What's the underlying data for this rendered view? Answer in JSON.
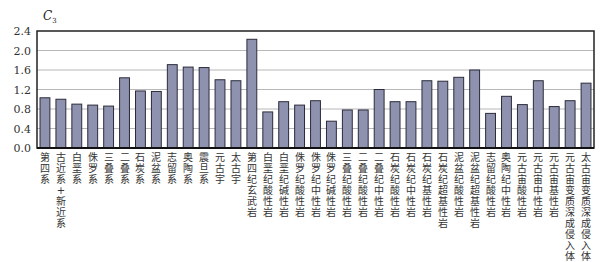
{
  "chart_data": {
    "type": "bar",
    "title": "",
    "xlabel": "",
    "ylabel": "C3",
    "ylabel_main": "C",
    "ylabel_sub": "3",
    "ylim": [
      0,
      2.4
    ],
    "yticks": [
      "0.0",
      "0.4",
      "0.8",
      "1.2",
      "1.6",
      "2.0",
      "2.4"
    ],
    "grid": true,
    "legend": null,
    "bar_color": "#8e92ae",
    "bar_edge_color": "#2b2b3a",
    "categories": [
      "第四系",
      "古近系+新近系",
      "白垩系",
      "侏罗系",
      "三叠系",
      "二叠系",
      "石炭系",
      "泥盆系",
      "志留系",
      "奥陶系",
      "震旦系",
      "元古宇",
      "太古宇",
      "第四纪玄武岩",
      "白垩纪酸性岩",
      "白垩纪碱性岩",
      "侏罗纪酸性岩",
      "侏罗纪中性岩",
      "侏罗纪碱性岩",
      "三叠纪酸性岩",
      "二叠纪酸性岩",
      "二叠纪中性岩",
      "石炭纪酸性岩",
      "石炭纪中性岩",
      "石炭纪基性岩",
      "石炭纪超基性岩",
      "泥盆纪酸性岩",
      "泥盆纪超基性岩",
      "志留纪酸性岩",
      "奥陶纪中性岩",
      "元古宙酸性岩",
      "元古宙中性岩",
      "元古宙基性岩",
      "元古宙变质深成侵入体",
      "太古宙变质深成侵入体"
    ],
    "values": [
      1.03,
      1.0,
      0.9,
      0.88,
      0.86,
      1.44,
      1.17,
      1.16,
      1.71,
      1.66,
      1.65,
      1.4,
      1.38,
      2.23,
      0.74,
      0.95,
      0.88,
      0.97,
      0.55,
      0.78,
      0.78,
      1.2,
      0.95,
      0.95,
      1.38,
      1.37,
      1.45,
      1.6,
      0.71,
      1.06,
      0.89,
      1.38,
      0.85,
      0.97,
      1.33
    ]
  }
}
